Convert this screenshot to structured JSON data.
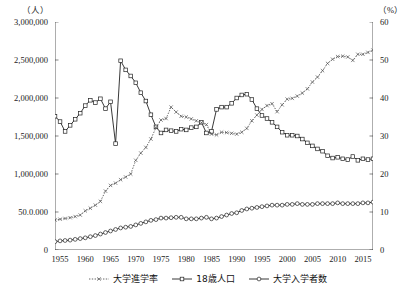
{
  "chart_data": {
    "type": "line",
    "title": "",
    "xlabel": "",
    "ylabel_left_unit": "（人）",
    "ylabel_right_unit": "（%）",
    "x_ticks": [
      "1955",
      "1960",
      "1965",
      "1970",
      "1975",
      "1980",
      "1985",
      "1990",
      "1995",
      "2000",
      "2005",
      "2010",
      "2015"
    ],
    "y_ticks_left": [
      "3,000,000",
      "2,500,000",
      "2,000,000",
      "1,500,000",
      "1,000,000",
      "50.0.000",
      "0"
    ],
    "y_ticks_right": [
      "60",
      "50",
      "40",
      "30",
      "20",
      "10",
      "0"
    ],
    "ylim_left": [
      0,
      3000000
    ],
    "ylim_right": [
      0,
      60
    ],
    "xlim": [
      1954,
      2017
    ],
    "grid": false,
    "legend_position": "bottom-center",
    "x": [
      1954,
      1955,
      1956,
      1957,
      1958,
      1959,
      1960,
      1961,
      1962,
      1963,
      1964,
      1965,
      1966,
      1967,
      1968,
      1969,
      1970,
      1971,
      1972,
      1973,
      1974,
      1975,
      1976,
      1977,
      1978,
      1979,
      1980,
      1981,
      1982,
      1983,
      1984,
      1985,
      1986,
      1987,
      1988,
      1989,
      1990,
      1991,
      1992,
      1993,
      1994,
      1995,
      1996,
      1997,
      1998,
      1999,
      2000,
      2001,
      2002,
      2003,
      2004,
      2005,
      2006,
      2007,
      2008,
      2009,
      2010,
      2011,
      2012,
      2013,
      2014,
      2015,
      2016,
      2017
    ],
    "series": [
      {
        "name": "18歳人口",
        "axis": "left",
        "unit": "人",
        "marker": "square",
        "line": "solid",
        "color": "#222222",
        "values": [
          1760000,
          1690000,
          1560000,
          1640000,
          1720000,
          1800000,
          1900000,
          1970000,
          1940000,
          1990000,
          1860000,
          1950000,
          1400000,
          2490000,
          2370000,
          2290000,
          2200000,
          2070000,
          1960000,
          1780000,
          1620000,
          1540000,
          1580000,
          1570000,
          1560000,
          1590000,
          1580000,
          1610000,
          1620000,
          1680000,
          1540000,
          1560000,
          1850000,
          1880000,
          1880000,
          1930000,
          2000000,
          2040000,
          2050000,
          1980000,
          1860000,
          1770000,
          1730000,
          1680000,
          1620000,
          1550000,
          1510000,
          1510000,
          1500000,
          1460000,
          1410000,
          1370000,
          1330000,
          1300000,
          1240000,
          1210000,
          1220000,
          1200000,
          1190000,
          1230000,
          1180000,
          1200000,
          1190000,
          1200000
        ]
      },
      {
        "name": "大学入学者数",
        "axis": "left",
        "unit": "人",
        "marker": "circle",
        "line": "solid",
        "color": "#222222",
        "values": [
          110000,
          120000,
          125000,
          130000,
          140000,
          150000,
          160000,
          175000,
          190000,
          210000,
          230000,
          250000,
          270000,
          290000,
          300000,
          310000,
          330000,
          350000,
          370000,
          390000,
          400000,
          420000,
          420000,
          425000,
          430000,
          430000,
          410000,
          410000,
          410000,
          420000,
          430000,
          410000,
          420000,
          440000,
          460000,
          480000,
          490000,
          520000,
          540000,
          550000,
          560000,
          570000,
          580000,
          590000,
          590000,
          590000,
          600000,
          600000,
          610000,
          600000,
          600000,
          600000,
          610000,
          610000,
          610000,
          610000,
          620000,
          610000,
          610000,
          610000,
          610000,
          620000,
          620000,
          630000
        ]
      },
      {
        "name": "大学進学率",
        "axis": "right",
        "unit": "%",
        "marker": "cross",
        "line": "dotted",
        "color": "#555555",
        "values": [
          7.9,
          8.1,
          8.3,
          8.5,
          8.8,
          9.2,
          10.3,
          11.0,
          11.8,
          12.8,
          15.5,
          17.0,
          17.6,
          18.5,
          19.2,
          20.0,
          23.6,
          25.5,
          27.0,
          29.2,
          32.2,
          34.2,
          34.6,
          37.6,
          36.3,
          35.2,
          35.0,
          34.5,
          34.0,
          33.5,
          33.0,
          30.5,
          30.3,
          31.0,
          30.9,
          30.7,
          30.5,
          31.0,
          32.0,
          34.0,
          35.5,
          37.0,
          38.0,
          38.5,
          36.4,
          38.2,
          39.7,
          39.9,
          40.5,
          41.3,
          42.4,
          44.2,
          45.5,
          47.2,
          49.1,
          50.2,
          50.9,
          51.0,
          50.8,
          49.9,
          51.5,
          51.5,
          52.0,
          52.6
        ]
      }
    ],
    "legend": [
      {
        "label": "大学進学率",
        "marker": "cross",
        "line": "dotted"
      },
      {
        "label": "18歳人口",
        "marker": "square",
        "line": "solid"
      },
      {
        "label": "大学入学者数",
        "marker": "circle",
        "line": "solid"
      }
    ]
  }
}
